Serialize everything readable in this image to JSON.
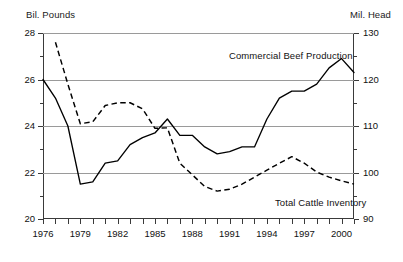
{
  "header": {
    "left_axis_units": "Bil. Pounds",
    "right_axis_units": "Mil. Head"
  },
  "annotations": {
    "beef_label": "Commercial Beef Production",
    "cattle_label": "Total Cattle Inventory"
  },
  "axes": {
    "left_ticks": [
      "28",
      "26",
      "24",
      "22",
      "20"
    ],
    "right_ticks": [
      "130",
      "120",
      "110",
      "100",
      "90"
    ],
    "x_ticks": [
      "1976",
      "1979",
      "1982",
      "1985",
      "1988",
      "1991",
      "1994",
      "1997",
      "2000"
    ]
  },
  "chart_data": {
    "type": "line",
    "title": "",
    "subtitle": "",
    "xlabel": "",
    "ylabel": "Bil. Pounds",
    "y2label": "Mil. Head",
    "xlim": [
      1976,
      2001
    ],
    "ylim": [
      20,
      28
    ],
    "y2lim": [
      90,
      130
    ],
    "grid": true,
    "grid_lines_left": [
      28,
      26,
      24,
      22
    ],
    "legend": "inline-annotations",
    "x": [
      1976,
      1977,
      1978,
      1979,
      1980,
      1981,
      1982,
      1983,
      1984,
      1985,
      1986,
      1987,
      1988,
      1989,
      1990,
      1991,
      1992,
      1993,
      1994,
      1995,
      1996,
      1997,
      1998,
      1999,
      2000,
      2001
    ],
    "series": [
      {
        "name": "Commercial Beef Production",
        "axis": "left",
        "units": "Bil. Pounds",
        "style": "solid",
        "color": "#000000",
        "values": [
          26.0,
          25.2,
          24.0,
          21.5,
          21.6,
          22.4,
          22.5,
          23.2,
          23.5,
          23.7,
          24.3,
          23.6,
          23.6,
          23.1,
          22.8,
          22.9,
          23.1,
          23.1,
          24.3,
          25.2,
          25.5,
          25.5,
          25.8,
          26.5,
          26.9,
          26.3
        ]
      },
      {
        "name": "Total Cattle Inventory",
        "axis": "right",
        "units": "Mil. Head",
        "style": "dashed",
        "color": "#000000",
        "values": [
          null,
          128.0,
          119.0,
          110.5,
          110.9,
          114.4,
          115.0,
          115.0,
          113.7,
          109.5,
          109.6,
          102.0,
          99.5,
          97.0,
          96.0,
          96.4,
          97.5,
          99.0,
          100.5,
          102.0,
          103.4,
          102.0,
          100.1,
          99.0,
          98.2,
          97.5
        ]
      }
    ]
  }
}
